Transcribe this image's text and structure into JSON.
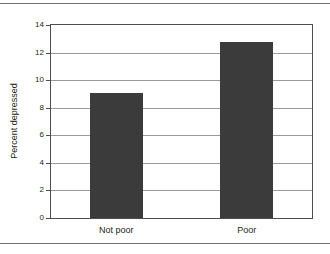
{
  "chart_data": {
    "type": "bar",
    "title": "",
    "xlabel": "",
    "ylabel": "Percent depressed",
    "categories": [
      "Not poor",
      "Poor"
    ],
    "values": [
      9.1,
      12.8
    ],
    "ylim": [
      0,
      14
    ],
    "yticks": [
      0,
      2,
      4,
      6,
      8,
      10,
      12,
      14
    ],
    "ytick_labels": [
      "0",
      "2",
      "4",
      "6",
      "8",
      "10",
      "12",
      "14"
    ],
    "grid": true,
    "legend": false,
    "legend_position": "none",
    "series": [
      {
        "name": "Percent depressed",
        "values": [
          9.1,
          12.8
        ]
      }
    ],
    "colors": {
      "bar": "#3b3b3b",
      "gridline": "#9a9a9a",
      "frame": "#4d4d4d",
      "rule": "#6f6f6f",
      "text": "#231f20",
      "background": "#ffffff"
    }
  }
}
